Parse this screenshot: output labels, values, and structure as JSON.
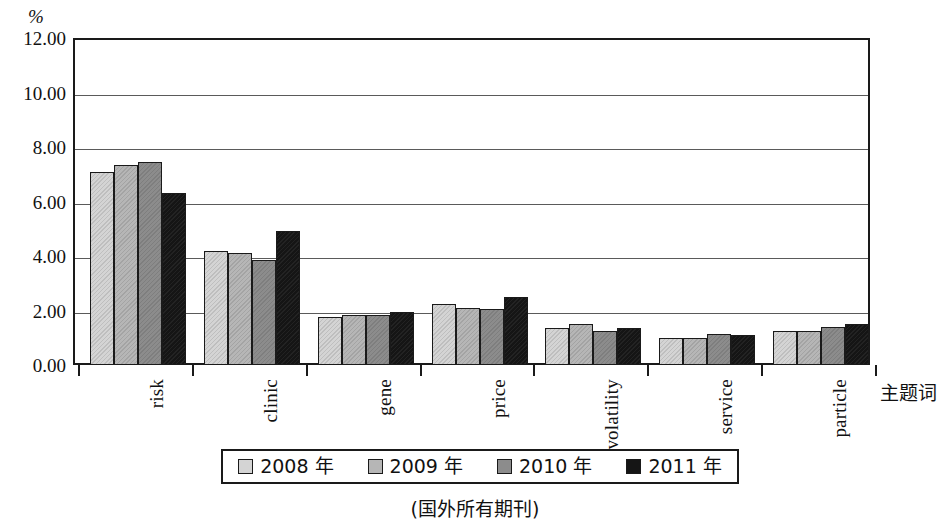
{
  "chart_data": {
    "type": "bar",
    "title": "",
    "subtitle": "",
    "xlabel": "主题词",
    "ylabel": "%",
    "yunit": "%",
    "ylim": [
      0,
      12
    ],
    "ytick_step": 2,
    "ytick_labels": [
      "0.00",
      "2.00",
      "4.00",
      "6.00",
      "8.00",
      "10.00",
      "12.00"
    ],
    "ytick_values": [
      0,
      2,
      4,
      6,
      8,
      10,
      12
    ],
    "grid": true,
    "grid_axis": "y",
    "legend_position": "bottom-center",
    "categories": [
      "risk",
      "clinic",
      "gene",
      "price",
      "volatility",
      "service",
      "particle"
    ],
    "series": [
      {
        "name": "2008 年",
        "color": "#d4d4d4",
        "values": [
          7.1,
          4.2,
          1.75,
          2.25,
          1.35,
          1.0,
          1.25
        ]
      },
      {
        "name": "2009 年",
        "color": "#b6b6b6",
        "values": [
          7.35,
          4.1,
          1.85,
          2.1,
          1.5,
          1.0,
          1.25
        ]
      },
      {
        "name": "2010 年",
        "color": "#8c8c8c",
        "values": [
          7.45,
          3.85,
          1.85,
          2.05,
          1.25,
          1.12,
          1.4
        ]
      },
      {
        "name": "2011 年",
        "color": "#151515",
        "values": [
          6.3,
          4.9,
          1.95,
          2.5,
          1.35,
          1.1,
          1.5
        ]
      }
    ],
    "caption": "(国外所有期刊)",
    "annotations": []
  },
  "legend": {
    "items": [
      {
        "label": "2008 年"
      },
      {
        "label": "2009 年"
      },
      {
        "label": "2010 年"
      },
      {
        "label": "2011 年"
      }
    ]
  }
}
